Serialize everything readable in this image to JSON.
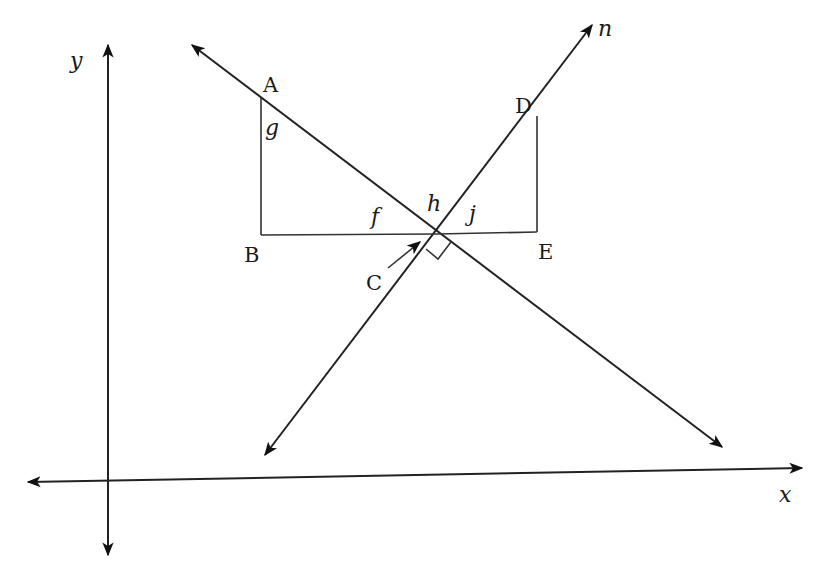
{
  "diagram": {
    "type": "geometry",
    "axes": {
      "x_label": "x",
      "y_label": "y"
    },
    "lines": {
      "n_label": "n"
    },
    "points": {
      "A": "A",
      "B": "B",
      "C": "C",
      "D": "D",
      "E": "E"
    },
    "angles": {
      "f": "f",
      "g": "g",
      "h": "h",
      "j": "j"
    },
    "relations": {
      "right_angle_at": "C",
      "triangles": [
        "ABC",
        "CDE"
      ]
    },
    "colors": {
      "line": "#222222",
      "background": "#ffffff"
    }
  }
}
